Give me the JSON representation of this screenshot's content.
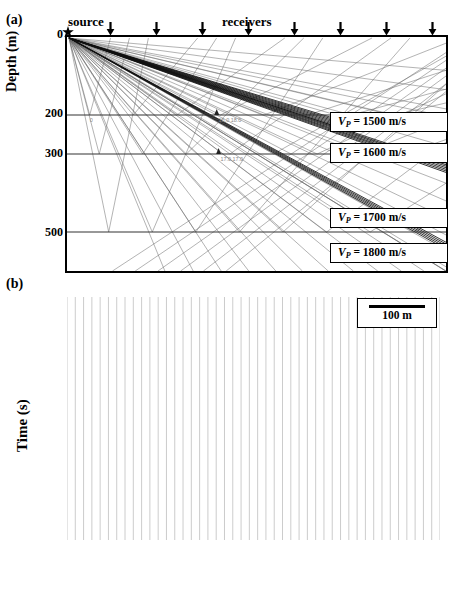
{
  "figure": {
    "panel_a_tag": "(a)",
    "panel_b_tag": "(b)"
  },
  "panel_a": {
    "source_label": "source",
    "receivers_label": "receivers",
    "y_axis_label": "Depth (m)",
    "depth_ticks": [
      {
        "label": "0",
        "depth": 0
      },
      {
        "label": "200",
        "depth": 200
      },
      {
        "label": "300",
        "depth": 300
      },
      {
        "label": "500",
        "depth": 500
      }
    ],
    "depth_range": [
      0,
      600
    ],
    "x_range_m": [
      0,
      1000
    ],
    "source_icon": "star-marker",
    "receiver_icon": "down-arrow-marker",
    "receiver_count": 9,
    "receiver_positions_m": [
      0,
      120,
      240,
      360,
      480,
      600,
      720,
      840,
      960
    ],
    "interfaces_m": [
      200,
      300,
      500
    ],
    "velocity_boxes": [
      {
        "symbol": "V",
        "sub": "P",
        "eq": " = 1500 m/s",
        "value": 1500,
        "layer": 1
      },
      {
        "symbol": "V",
        "sub": "P",
        "eq": " = 1600 m/s",
        "value": 1600,
        "layer": 2
      },
      {
        "symbol": "V",
        "sub": "P",
        "eq": " = 1700 m/s",
        "value": 1700,
        "layer": 3
      },
      {
        "symbol": "V",
        "sub": "P",
        "eq": " = 1800 m/s",
        "value": 1800,
        "layer": 4
      }
    ],
    "interface_annotations": [
      "16.0 18.0",
      "17.0 17.0",
      "0"
    ]
  },
  "panel_b": {
    "y_axis_label": "Time (s)",
    "y_ticks": [
      "0.2",
      "0.4",
      "0.6",
      "0.8"
    ],
    "y_tick_values": [
      0.2,
      0.4,
      0.6,
      0.8
    ],
    "x_ticks": [
      "1.00",
      "11.00",
      "21.00",
      "31.00",
      "41.00"
    ],
    "x_tick_values": [
      1,
      11,
      21,
      31,
      41
    ],
    "annotations": [
      {
        "label": "Layer 1",
        "x_frac": 0.33,
        "t": 0.395
      },
      {
        "label": "Layer 2",
        "x_frac": 0.33,
        "t": 0.585
      },
      {
        "label": "Layer 3",
        "x_frac": 0.33,
        "t": 0.775
      }
    ],
    "scalebar": {
      "label": "100 m",
      "icon": "horizontal-rule"
    }
  },
  "chart_data": {
    "type": "line",
    "title": "",
    "xlabel": "",
    "ylabel": "Time (s)",
    "xlim": [
      1,
      46
    ],
    "ylim": [
      0.2,
      0.92
    ],
    "y_inverted": true,
    "grid": true,
    "legend": "100 m scale bar, upper right",
    "n_traces": 46,
    "trace_spacing_m": 100,
    "series": [
      {
        "name": "Layer 1",
        "comment": "first refracted arrival, direct/top-layer refraction",
        "x": [
          1,
          2,
          3,
          4,
          5,
          6,
          7,
          8,
          9,
          10,
          11,
          12,
          13,
          14,
          15,
          16,
          17,
          18,
          19,
          20,
          21,
          22,
          23,
          24,
          25,
          26,
          27,
          28,
          29,
          30,
          31,
          32,
          33,
          34,
          35,
          36,
          37,
          38,
          39,
          40,
          41,
          42,
          43,
          44,
          45,
          46
        ],
        "values": [
          0.3,
          0.303,
          0.307,
          0.311,
          0.315,
          0.32,
          0.325,
          0.33,
          0.336,
          0.342,
          0.348,
          0.354,
          0.361,
          0.368,
          0.375,
          0.382,
          0.389,
          0.396,
          0.404,
          0.412,
          0.42,
          0.428,
          0.436,
          0.444,
          0.452,
          0.461,
          0.47,
          0.479,
          0.488,
          0.497,
          0.506,
          0.515,
          0.525,
          0.535,
          0.545,
          0.555,
          0.565,
          0.576,
          0.587,
          0.598,
          0.609,
          0.62,
          0.632,
          0.644,
          0.656,
          0.668
        ]
      },
      {
        "name": "Layer 2",
        "comment": "second refracted arrival from 300 m interface",
        "x": [
          1,
          2,
          3,
          4,
          5,
          6,
          7,
          8,
          9,
          10,
          11,
          12,
          13,
          14,
          15,
          16,
          17,
          18,
          19,
          20,
          21,
          22,
          23,
          24,
          25,
          26,
          27,
          28,
          29,
          30,
          31,
          32,
          33,
          34,
          35,
          36,
          37,
          38,
          39,
          40,
          41,
          42,
          43,
          44,
          45,
          46
        ],
        "values": [
          0.425,
          0.428,
          0.432,
          0.436,
          0.441,
          0.446,
          0.452,
          0.458,
          0.464,
          0.471,
          0.478,
          0.485,
          0.492,
          0.5,
          0.508,
          0.516,
          0.524,
          0.533,
          0.542,
          0.551,
          0.56,
          0.569,
          0.578,
          0.588,
          0.598,
          0.608,
          0.618,
          0.628,
          0.638,
          0.649,
          0.66,
          0.671,
          0.682,
          0.693,
          0.704,
          0.715,
          0.727,
          0.739,
          0.751,
          0.763,
          0.775,
          0.787,
          0.799,
          0.811,
          0.823,
          0.835
        ]
      },
      {
        "name": "Layer 3",
        "comment": "third refracted arrival from 500 m interface",
        "x": [
          1,
          2,
          3,
          4,
          5,
          6,
          7,
          8,
          9,
          10,
          11,
          12,
          13,
          14,
          15,
          16,
          17,
          18,
          19,
          20,
          21,
          22,
          23,
          24,
          25,
          26,
          27,
          28,
          29,
          30,
          31,
          32,
          33,
          34,
          35,
          36,
          37,
          38,
          39,
          40,
          41,
          42,
          43,
          44,
          45,
          46
        ],
        "values": [
          0.663,
          0.665,
          0.668,
          0.671,
          0.675,
          0.679,
          0.683,
          0.688,
          0.693,
          0.698,
          0.704,
          0.71,
          0.716,
          0.723,
          0.73,
          0.737,
          0.744,
          0.752,
          0.76,
          0.768,
          0.776,
          0.784,
          0.793,
          0.802,
          0.811,
          0.82,
          0.829,
          0.838,
          0.848,
          0.858,
          0.868,
          0.878,
          0.888,
          0.898,
          0.908,
          0.918,
          0.928,
          0.938,
          0.948,
          0.958,
          0.968,
          0.978,
          0.988,
          0.998,
          1.008,
          1.018
        ]
      }
    ]
  }
}
